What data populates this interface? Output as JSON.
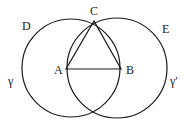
{
  "diagram": {
    "type": "geometric-construction",
    "colors": {
      "stroke": "#1a1a1a",
      "background": "#ffffff"
    },
    "labels": {
      "A": "A",
      "B": "B",
      "C": "C",
      "D": "D",
      "E": "E",
      "gamma": "γ",
      "gamma_prime": "γ′"
    },
    "points": {
      "A": [
        66,
        69
      ],
      "B": [
        121,
        69
      ],
      "C": [
        94,
        21
      ]
    },
    "circles": [
      {
        "name": "γ",
        "center": [
          71,
          68
        ],
        "r": 49
      },
      {
        "name": "γ′",
        "center": [
          117,
          68
        ],
        "r": 50
      }
    ]
  }
}
